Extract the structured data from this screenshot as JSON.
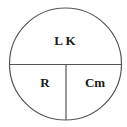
{
  "diagram": {
    "type": "formula-circle",
    "top_label": "L K",
    "bottom_left_label": "R",
    "bottom_right_label": "Cm",
    "stroke_color": "#555555",
    "text_color": "#1a1a1a"
  }
}
